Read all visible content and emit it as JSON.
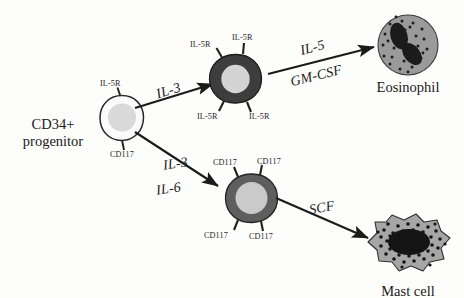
{
  "figure": {
    "background_color": "#fdfdfc",
    "ink_color": "#1a1a1a"
  },
  "cells": {
    "progenitor": {
      "name_line1": "CD34+",
      "name_line2": "progenitor",
      "receptors": [
        {
          "label": "IL-5R"
        },
        {
          "label": "CD117"
        }
      ],
      "cytoplasm_color": "#fbfbfb",
      "nucleus_color": "#d8d8d8",
      "outline_color": "#2a2a2a"
    },
    "eosinophil_precursor": {
      "receptors": [
        {
          "label": "IL-5R"
        },
        {
          "label": "IL-5R"
        },
        {
          "label": "IL-5R"
        },
        {
          "label": "IL-5R"
        }
      ],
      "cytoplasm_color": "#3d3d3d",
      "nucleus_color": "#d2d2d2",
      "outline_color": "#1c1c1c"
    },
    "mast_precursor": {
      "receptors": [
        {
          "label": "CD117"
        },
        {
          "label": "CD117"
        },
        {
          "label": "CD117"
        },
        {
          "label": "CD117"
        }
      ],
      "cytoplasm_color": "#5e5e5e",
      "nucleus_color": "#c9c9c9",
      "outline_color": "#242424"
    },
    "eosinophil": {
      "name": "Eosinophil",
      "cytoplasm_color": "#9a9a9a",
      "nucleus_color": "#1b1b1b",
      "granule_color": "#1b1b1b",
      "granule_count": 26
    },
    "mast_cell": {
      "name": "Mast cell",
      "cytoplasm_color": "#a6a6a6",
      "nucleus_color": "#141414",
      "granule_color": "#141414",
      "granule_count": 42
    }
  },
  "arrows": [
    {
      "id": "progenitor-to-eosinophil-precursor",
      "labels": [
        "IL-3"
      ]
    },
    {
      "id": "eosinophil-precursor-to-eosinophil",
      "labels": [
        "IL-5",
        "GM-CSF"
      ]
    },
    {
      "id": "progenitor-to-mast-precursor",
      "labels": [
        "IL-3",
        "IL-6"
      ]
    },
    {
      "id": "mast-precursor-to-mast-cell",
      "labels": [
        "SCF"
      ]
    }
  ],
  "labels": {
    "il3_top": "IL-3",
    "il5": "IL-5",
    "gmcsf": "GM-CSF",
    "il3_bottom": "IL-3",
    "il6": "IL-6",
    "scf": "SCF",
    "il5r_prog": "IL-5R",
    "cd117_prog": "CD117",
    "il5r_a": "IL-5R",
    "il5r_b": "IL-5R",
    "il5r_c": "IL-5R",
    "il5r_d": "IL-5R",
    "cd117_a": "CD117",
    "cd117_b": "CD117",
    "cd117_c": "CD117",
    "cd117_d": "CD117",
    "eosinophil_name": "Eosinophil",
    "mast_name": "Mast cell",
    "prog_line1": "CD34+",
    "prog_line2": "progenitor"
  }
}
